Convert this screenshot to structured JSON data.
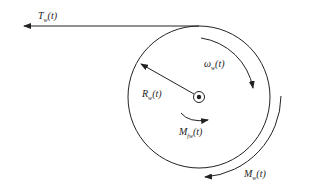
{
  "diagram": {
    "labels": {
      "tension": {
        "base": "T",
        "sub": "w",
        "arg": "(t)"
      },
      "angular_velocity": {
        "base": "ω",
        "sub": "w",
        "arg": "(t)"
      },
      "radius": {
        "base": "R",
        "sub": "w",
        "arg": "(t)"
      },
      "friction_moment": {
        "base": "M",
        "sub": "fw",
        "arg": "(t)"
      },
      "moment": {
        "base": "M",
        "sub": "w",
        "arg": "(t)"
      }
    },
    "colors": {
      "stroke": "#222222",
      "background": "#ffffff"
    }
  }
}
